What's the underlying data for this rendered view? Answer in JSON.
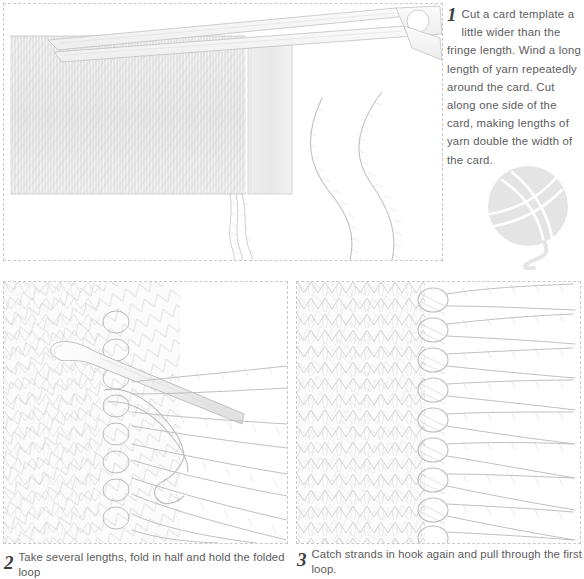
{
  "document": {
    "title": "How to make and attach yarn fringe",
    "type": "illustrated step-by-step craft instructions",
    "background_color": "#ffffff",
    "text_color": "#5b5b5d",
    "line_color": "#b4b4b6",
    "panel_border_color": "#c9c9c9",
    "panel_border_style": "dashed"
  },
  "steps": [
    {
      "number": "1",
      "text": "Cut a card template a little wider than the fringe length. Wind a long length of yarn repeatedly around the card. Cut along one side of the card, making lengths of yarn double the width of the card.",
      "lines": [
        "Cut a card template a little",
        "wider than the fringe length.",
        "Wind a long length of yarn",
        "repeatedly around the card.",
        "Cut along one side of the",
        "card, making lengths of yarn",
        "double the width of the card."
      ],
      "caption_position": "right",
      "illustration": "card wound with yarn, open scissors cutting along one edge, and two cut lengths of twisted yarn curving away"
    },
    {
      "number": "2",
      "text": "Take several lengths, fold in half and hold the folded loop",
      "caption_position": "below",
      "illustration": "knitted fabric edge with a crochet hook drawing a folded loop of yarn strands through the fabric"
    },
    {
      "number": "3",
      "text": "Catch strands in hook again and pull through the first loop.",
      "caption_position": "below",
      "illustration": "knitted fabric edge with completed knotted fringe tassels along the selvedge"
    }
  ],
  "decorations": [
    {
      "name": "yarn-ball-mark",
      "description": "pale grey ball of yarn with a trailing strand",
      "color": "#e3e3e3"
    }
  ]
}
